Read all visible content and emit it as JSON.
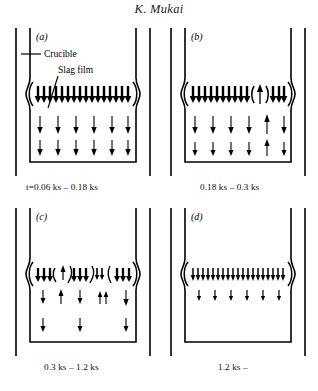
{
  "header": {
    "title": "K. Mukai"
  },
  "figure": {
    "labels": {
      "crucible": "Crucible",
      "slag_film": "Slag film"
    },
    "panels": [
      {
        "id": "a",
        "letter": "(a)",
        "caption": "t=0.06 ks – 0.18 ks",
        "time_start_ks": 0.06,
        "time_end_ks": 0.18,
        "description": "Continuous slag film with dense bold downward arrows; two rows of thin downward arrows below",
        "slag_row": {
          "style": "continuous-bold",
          "arrow_count": 16,
          "direction": "down"
        },
        "bulk_rows": [
          {
            "count": 6,
            "directions": [
              "down",
              "down",
              "down",
              "down",
              "down",
              "down"
            ],
            "size": "large"
          },
          {
            "count": 6,
            "directions": [
              "down",
              "down",
              "down",
              "down",
              "down",
              "down"
            ],
            "size": "large"
          }
        ]
      },
      {
        "id": "b",
        "letter": "(b)",
        "caption": "0.18 ks – 0.3 ks",
        "time_start_ks": 0.18,
        "time_end_ks": 0.3,
        "description": "Slag film ruptured near right side; one upward arrow in the gap; bulk rows show one upward arrow",
        "slag_row": {
          "style": "broken-right",
          "arrow_count": 13,
          "direction": "down",
          "break_positions": [
            10
          ],
          "gap_arrow_direction": "up"
        },
        "bulk_rows": [
          {
            "count": 6,
            "directions": [
              "down",
              "down",
              "down",
              "down",
              "up",
              "down"
            ],
            "size": "large"
          },
          {
            "count": 6,
            "directions": [
              "down",
              "down",
              "down",
              "down",
              "up",
              "down"
            ],
            "size": "medium"
          }
        ]
      },
      {
        "id": "c",
        "letter": "(c)",
        "caption": "0.3 ks – 1.2 ks",
        "time_start_ks": 0.3,
        "time_end_ks": 1.2,
        "description": "Slag film fragmented into several islands separated by curved menisci; mixed up and down arrows",
        "slag_row": {
          "style": "fragmented",
          "segments": [
            {
              "arrows": 3,
              "direction": "down",
              "size": "bold"
            },
            {
              "arrows": 1,
              "direction": "up",
              "size": "small"
            },
            {
              "arrows": 3,
              "direction": "down",
              "size": "bold"
            },
            {
              "arrows": 2,
              "direction": "down",
              "size": "small"
            },
            {
              "arrows": 3,
              "direction": "down",
              "size": "bold"
            }
          ]
        },
        "bulk_rows": [
          {
            "count": 5,
            "directions": [
              "down",
              "up",
              "down",
              "up",
              "down"
            ],
            "size": "medium"
          },
          {
            "count": 3,
            "directions": [
              "down",
              "down",
              "down"
            ],
            "size": "medium"
          }
        ]
      },
      {
        "id": "d",
        "letter": "(d)",
        "caption": "1.2 ks –",
        "time_start_ks": 1.2,
        "time_end_ks": null,
        "description": "Slag film fully dispersed; uniform row of thin downward arrows and sparse row beneath",
        "slag_row": {
          "style": "uniform-thin",
          "arrow_count": 19,
          "direction": "down"
        },
        "bulk_rows": [
          {
            "count": 7,
            "directions": [
              "down",
              "down",
              "down",
              "down",
              "down",
              "down",
              "down"
            ],
            "size": "small"
          }
        ]
      }
    ]
  },
  "colors": {
    "ink": "#000000",
    "background": "#ffffff"
  }
}
